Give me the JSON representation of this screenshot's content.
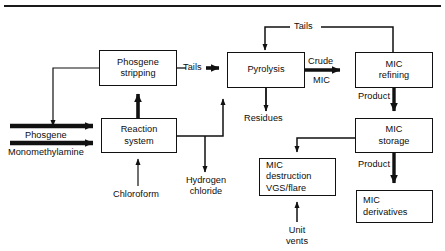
{
  "figure": {
    "type": "process-flow-diagram",
    "top_rule": true
  },
  "nodes": [
    {
      "id": "phosgene-stripping",
      "lines": [
        "Phosgene",
        "stripping"
      ],
      "x": 99,
      "y": 50,
      "w": 78,
      "h": 36
    },
    {
      "id": "reaction-system",
      "lines": [
        "Reaction",
        "system"
      ],
      "x": 101,
      "y": 118,
      "w": 76,
      "h": 35
    },
    {
      "id": "pyrolysis",
      "lines": [
        "Pyrolysis"
      ],
      "x": 227,
      "y": 52,
      "w": 78,
      "h": 36
    },
    {
      "id": "mic-refining",
      "lines": [
        "MIC",
        "refining"
      ],
      "x": 355,
      "y": 52,
      "w": 78,
      "h": 36
    },
    {
      "id": "mic-storage",
      "lines": [
        "MIC",
        "storage"
      ],
      "x": 355,
      "y": 118,
      "w": 78,
      "h": 35
    },
    {
      "id": "mic-destruction",
      "lines": [
        "MIC",
        "destruction",
        "VGS/flare"
      ],
      "x": 259,
      "y": 158,
      "w": 77,
      "h": 38
    },
    {
      "id": "mic-derivatives",
      "lines": [
        "MIC",
        "derivatives"
      ],
      "x": 356,
      "y": 190,
      "w": 77,
      "h": 33
    }
  ],
  "labels": {
    "tails_top": "Tails",
    "tails_mid": "Tails",
    "crude": "Crude",
    "mic": "MIC",
    "product_refining": "Product",
    "product_storage": "Product",
    "residues": "Residues",
    "phosgene_feed": "Phosgene",
    "monomethylamine_feed": "Monomethylamine",
    "chloroform_feed": "Chloroform",
    "hydrogen": "Hydrogen",
    "chloride": "chloride",
    "unit": "Unit",
    "vents": "vents"
  },
  "colors": {
    "line": "#111111",
    "text": "#0d0d0d",
    "background": "#ffffff"
  }
}
